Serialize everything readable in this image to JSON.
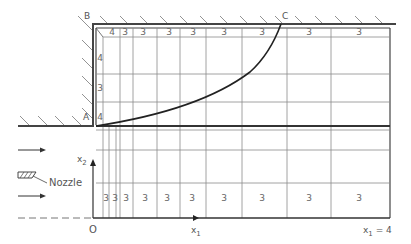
{
  "diagram": {
    "points": {
      "A": "A",
      "B": "B",
      "C": "C",
      "O": "O"
    },
    "axes": {
      "x1": "x",
      "x1_sub": "1",
      "x2": "x",
      "x2_sub": "2",
      "x1_end": "x",
      "x1_end_sub": "1",
      "x1_end_value": " = 4"
    },
    "nozzle_label": "Nozzle",
    "grid_x": [
      103,
      109,
      116,
      131,
      153,
      177,
      206,
      242,
      287,
      331,
      390
    ],
    "top_row_labels": [
      {
        "x": 112,
        "t": "4"
      },
      {
        "x": 125,
        "t": "3"
      },
      {
        "x": 143,
        "t": "3"
      },
      {
        "x": 169,
        "t": "3"
      },
      {
        "x": 193,
        "t": "3"
      },
      {
        "x": 224,
        "t": "3"
      },
      {
        "x": 262,
        "t": "3"
      },
      {
        "x": 309,
        "t": "3"
      },
      {
        "x": 359,
        "t": "3"
      }
    ],
    "left_col_labels": [
      {
        "y": 59,
        "t": "4"
      },
      {
        "y": 89,
        "t": "3"
      },
      {
        "y": 118,
        "t": "4"
      }
    ],
    "bottom_row_labels": [
      {
        "x": 106,
        "t": "3"
      },
      {
        "x": 115,
        "t": "3"
      },
      {
        "x": 126,
        "t": "3"
      },
      {
        "x": 145,
        "t": "3"
      },
      {
        "x": 167,
        "t": "3"
      },
      {
        "x": 192,
        "t": "3"
      },
      {
        "x": 224,
        "t": "3"
      },
      {
        "x": 262,
        "t": "3"
      },
      {
        "x": 309,
        "t": "3"
      },
      {
        "x": 359,
        "t": "3"
      }
    ]
  }
}
